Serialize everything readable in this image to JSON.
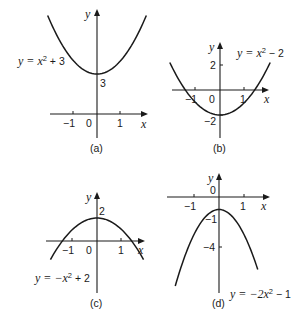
{
  "figure": {
    "panels": [
      {
        "id": "a",
        "caption": "(a)",
        "equation": {
          "prefix": "y = x",
          "sup": "2",
          "suffix": " + 3"
        },
        "function": {
          "a": 1,
          "c": 3
        },
        "x_label": "x",
        "y_label": "y",
        "x_ticks": [
          {
            "value": -1,
            "label": "−1"
          },
          {
            "value": 1,
            "label": "1"
          }
        ],
        "y_ticks": [],
        "origin_label": "0",
        "vertex_label": "3",
        "x_range": [
          -2.1,
          2.1
        ]
      },
      {
        "id": "b",
        "caption": "(b)",
        "equation": {
          "prefix": "y = x",
          "sup": "2",
          "suffix": " − 2"
        },
        "function": {
          "a": 1,
          "c": -2
        },
        "x_label": "x",
        "y_label": "y",
        "x_ticks": [
          {
            "value": -1,
            "label": "−1"
          },
          {
            "value": 1,
            "label": "1"
          }
        ],
        "y_ticks": [
          {
            "value": 2,
            "label": "2"
          },
          {
            "value": -2,
            "label": "−2"
          }
        ],
        "origin_label": "0",
        "x_range": [
          -2.05,
          2.05
        ]
      },
      {
        "id": "c",
        "caption": "(c)",
        "equation": {
          "prefix": "y = −x",
          "sup": "2",
          "suffix": " + 2"
        },
        "function": {
          "a": -1,
          "c": 2
        },
        "x_label": "x",
        "y_label": "y",
        "x_ticks": [
          {
            "value": -1,
            "label": "−1"
          },
          {
            "value": 1,
            "label": "1"
          }
        ],
        "y_ticks": [],
        "origin_label": "0",
        "vertex_label": "2",
        "x_range": [
          -1.9,
          1.9
        ]
      },
      {
        "id": "d",
        "caption": "(d)",
        "equation": {
          "prefix": "y = −2x",
          "sup": "2",
          "suffix": " − 1"
        },
        "function": {
          "a": -2,
          "c": -1
        },
        "x_label": "x",
        "y_label": "y",
        "x_ticks": [
          {
            "value": -1,
            "label": "−1"
          },
          {
            "value": 1,
            "label": "1"
          }
        ],
        "y_ticks": [
          {
            "value": -1,
            "label": "−1"
          },
          {
            "value": -4,
            "label": "−4"
          }
        ],
        "origin_label": "0",
        "x_range": [
          -1.75,
          1.55
        ]
      }
    ]
  }
}
